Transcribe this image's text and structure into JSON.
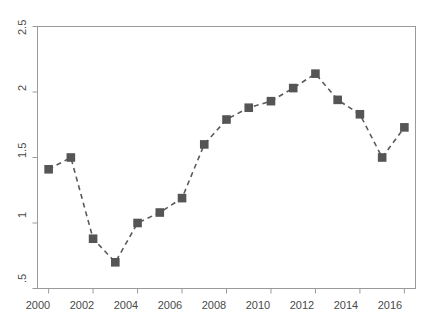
{
  "chart_data": {
    "type": "line",
    "title": "",
    "subtitle": "",
    "xlabel": "",
    "ylabel": "",
    "x": [
      2000,
      2001,
      2002,
      2003,
      2004,
      2005,
      2006,
      2007,
      2008,
      2009,
      2010,
      2011,
      2012,
      2013,
      2014,
      2015,
      2016
    ],
    "values": [
      1.41,
      1.5,
      0.88,
      0.7,
      1.0,
      1.08,
      1.19,
      1.6,
      1.79,
      1.88,
      1.93,
      2.03,
      2.14,
      1.94,
      1.83,
      1.5,
      1.73
    ],
    "series": [
      {
        "name": "series-1",
        "values": [
          1.41,
          1.5,
          0.88,
          0.7,
          1.0,
          1.08,
          1.19,
          1.6,
          1.79,
          1.88,
          1.93,
          2.03,
          2.14,
          1.94,
          1.83,
          1.5,
          1.73
        ]
      }
    ],
    "xlim": [
      1999.5,
      2016.5
    ],
    "ylim": [
      0.5,
      2.5
    ],
    "xticks": [
      2000,
      2002,
      2004,
      2006,
      2008,
      2010,
      2012,
      2014,
      2016
    ],
    "xtick_labels": [
      "2000",
      "2002",
      "2004",
      "2006",
      "2008",
      "2010",
      "2012",
      "2014",
      "2016"
    ],
    "yticks": [
      0.5,
      1,
      1.5,
      2,
      2.5
    ],
    "ytick_labels": [
      ".5",
      "1",
      "1.5",
      "2",
      "2.5"
    ],
    "grid": false,
    "legend": null,
    "legend_position": "none",
    "line_style": "dashed",
    "marker": "square",
    "line_color": "#5a5a5a",
    "marker_color": "#555555",
    "axis_color": "#9a9a9a",
    "tick_label_color": "#4a4a4a",
    "background_color": "#ffffff",
    "annotations": []
  }
}
